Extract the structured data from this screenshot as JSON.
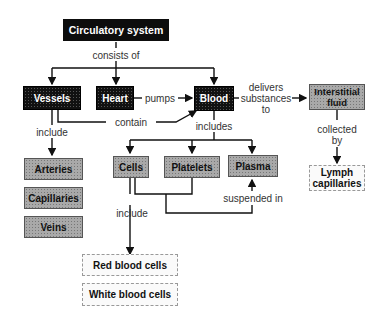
{
  "diagram": {
    "root": "Circulatory system",
    "nodes": {
      "vessels": "Vessels",
      "heart": "Heart",
      "blood": "Blood",
      "interstitial_fluid": "Interstitial fluid",
      "arteries": "Arteries",
      "capillaries": "Capillaries",
      "veins": "Veins",
      "cells": "Cells",
      "platelets": "Platelets",
      "plasma": "Plasma",
      "lymph_capillaries": "Lymph capillaries",
      "red_blood_cells": "Red blood cells",
      "white_blood_cells": "White blood cells"
    },
    "links": {
      "consists_of": "consists of",
      "pumps": "pumps",
      "contain": "contain",
      "delivers_1": "delivers",
      "delivers_2": "substances",
      "delivers_3": "to",
      "include_vessels": "include",
      "includes_blood": "includes",
      "collected_1": "collected",
      "collected_2": "by",
      "include_cells": "include",
      "suspended_in": "suspended in"
    }
  }
}
